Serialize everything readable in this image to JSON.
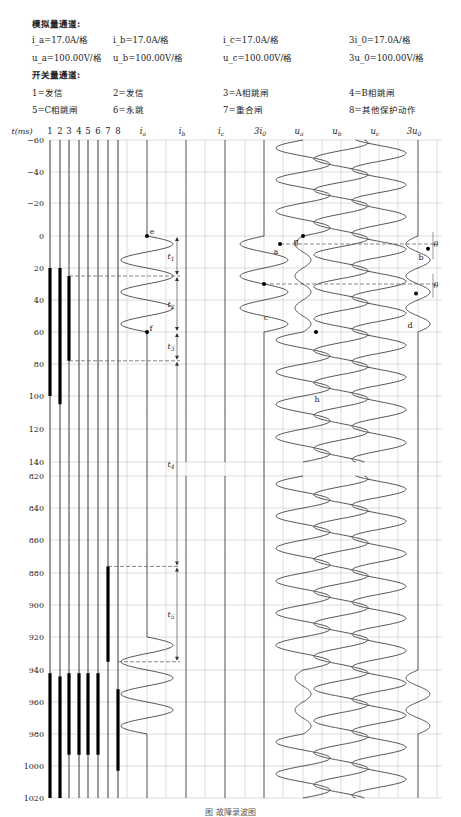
{
  "legend": {
    "analog_title": "模拟量通道:",
    "analog": [
      [
        "i_a=17.0A/格",
        "i_b=17.0A/格",
        "i_c=17.0A/格",
        "3i_0=17.0A/格"
      ],
      [
        "u_a=100.00V/格",
        "u_b=100.00V/格",
        "u_c=100.00V/格",
        "3u_0=100.00V/格"
      ]
    ],
    "switch_title": "开关量通道:",
    "switch": [
      [
        "1=发信",
        "2=发信",
        "3=A相跳闸",
        "4=B相跳闸"
      ],
      [
        "5=C相跳闸",
        "6=永跳",
        "7=重合闸",
        "8=其他保护动作"
      ]
    ]
  },
  "chart_data": {
    "type": "line",
    "title": "故障录波图",
    "xlabel": "",
    "ylabel": "t(ms)",
    "time_axis_ticks": [
      -60,
      -40,
      -20,
      0,
      20,
      40,
      60,
      80,
      100,
      120,
      140,
      820,
      840,
      860,
      880,
      900,
      920,
      940,
      960,
      980,
      1000,
      1020
    ],
    "axis_break": "140 → 820",
    "digital_channels": [
      "1",
      "2",
      "3",
      "4",
      "5",
      "6",
      "7",
      "8"
    ],
    "analog_channels": [
      "i_a",
      "i_b",
      "i_c",
      "3i_0",
      "u_a",
      "u_b",
      "u_c",
      "3u_0"
    ],
    "digital_active_ms": {
      "1": [
        [
          20,
          100
        ],
        [
          942,
          1020
        ]
      ],
      "2": [
        [
          20,
          105
        ],
        [
          944,
          1020
        ]
      ],
      "3": [
        [
          25,
          78
        ],
        [
          942,
          993
        ]
      ],
      "4": [
        [
          942,
          993
        ]
      ],
      "5": [
        [
          942,
          993
        ]
      ],
      "6": [
        [
          942,
          993
        ]
      ],
      "7": [
        [
          876,
          935
        ]
      ],
      "8": [
        [
          952,
          1003
        ]
      ]
    },
    "analog_traces": {
      "i_a": "zero until 0ms; fault current sine 0–60ms; zero 60–920ms; reclose-fault sine 920–980ms; zero after",
      "i_b": "zero throughout",
      "i_c": "zero throughout",
      "3i_0": "zero until 0ms; sine 0–60ms; zero after",
      "u_a": "normal sine; depressed 5–60ms; normal 60–940ms; depressed 940–980ms; normal after",
      "u_b": "normal sine throughout",
      "u_c": "normal sine throughout",
      "3u_0": "zero until 0ms; sine 0–60ms; zero until 940ms; sine 940–980ms; zero after"
    },
    "markers": [
      {
        "label": "e",
        "channel": "i_a",
        "t_ms": 0
      },
      {
        "label": "f",
        "channel": "i_a",
        "t_ms": 60
      },
      {
        "label": "a",
        "channel": "3i_0",
        "t_ms": 5
      },
      {
        "label": "c",
        "channel": "3i_0",
        "t_ms": 30
      },
      {
        "label": "g",
        "channel": "u_a",
        "t_ms": 0
      },
      {
        "label": "h",
        "channel": "u_a",
        "t_ms": 60
      },
      {
        "label": "b",
        "channel": "3u_0",
        "t_ms": 8
      },
      {
        "label": "d",
        "channel": "3u_0",
        "t_ms": 36
      }
    ],
    "intervals": [
      {
        "label": "t1",
        "from_ms": 0,
        "to_ms": 25
      },
      {
        "label": "t2",
        "from_ms": 25,
        "to_ms": 60
      },
      {
        "label": "t3",
        "from_ms": 60,
        "to_ms": 78
      },
      {
        "label": "t4",
        "from_ms": 78,
        "to_ms": 876
      },
      {
        "label": "t5",
        "from_ms": 876,
        "to_ms": 935
      }
    ],
    "angle_label": "θ",
    "grid": true
  },
  "caption": "图 故障录波图"
}
